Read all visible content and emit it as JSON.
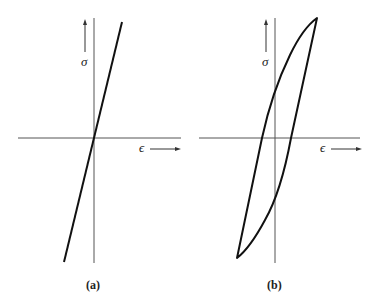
{
  "panels": [
    {
      "id": "a",
      "caption": "(a)",
      "y_label": "σ",
      "x_label": "ϵ",
      "description": "linear elastic stress-strain line through origin"
    },
    {
      "id": "b",
      "caption": "(b)",
      "y_label": "σ",
      "x_label": "ϵ",
      "description": "hysteresis loop stress-strain curve"
    }
  ],
  "colors": {
    "line": "#111111",
    "axis": "#444444",
    "background": "#ffffff"
  }
}
